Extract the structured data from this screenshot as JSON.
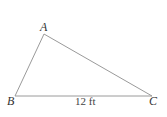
{
  "diagram": {
    "type": "triangle",
    "vertices": [
      {
        "name": "A",
        "x": 44,
        "y": 34
      },
      {
        "name": "B",
        "x": 15,
        "y": 96
      },
      {
        "name": "C",
        "x": 152,
        "y": 96
      }
    ],
    "labels": {
      "A": "A",
      "B": "B",
      "C": "C"
    },
    "side_BC_label": "12 ft",
    "line_color": "#9a9a9a"
  }
}
